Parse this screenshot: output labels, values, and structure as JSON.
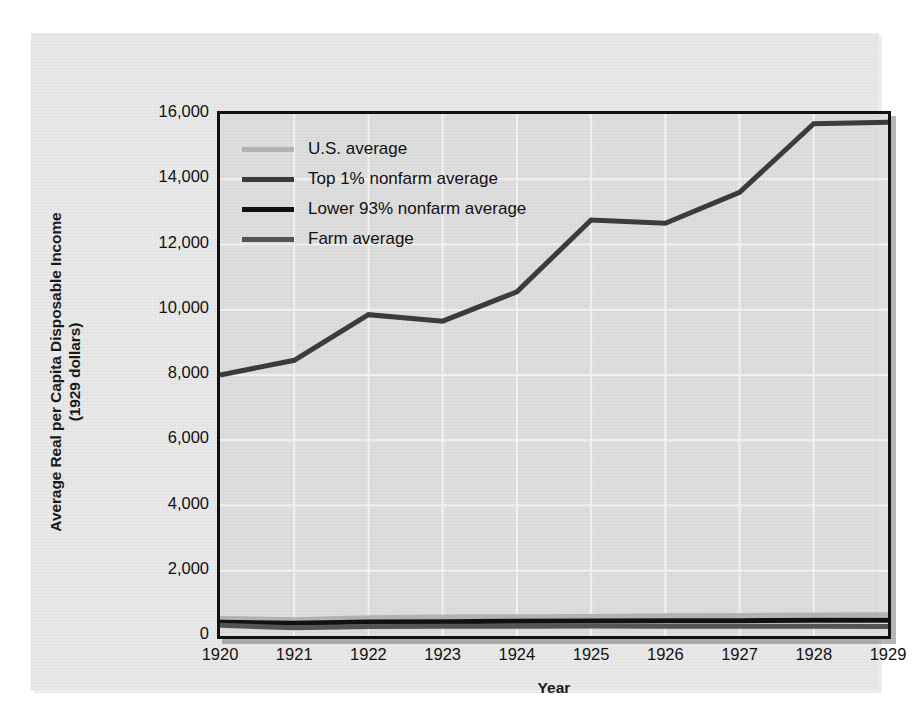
{
  "chart_data": {
    "type": "line",
    "title": "",
    "xlabel": "Year",
    "ylabel": "Average Real per Capita Disposable Income (1929 dollars)",
    "ylabel_line1": "Average Real per Capita Disposable Income",
    "ylabel_line2": "(1929 dollars)",
    "x": [
      1920,
      1921,
      1922,
      1923,
      1924,
      1925,
      1926,
      1927,
      1928,
      1929
    ],
    "categories": [
      "1920",
      "1921",
      "1922",
      "1923",
      "1924",
      "1925",
      "1926",
      "1927",
      "1928",
      "1929"
    ],
    "xlim": [
      1920,
      1929
    ],
    "ylim": [
      0,
      16000
    ],
    "yticks": [
      0,
      2000,
      4000,
      6000,
      8000,
      10000,
      12000,
      14000,
      16000
    ],
    "ytick_labels": [
      "0",
      "2,000",
      "4,000",
      "6,000",
      "8,000",
      "10,000",
      "12,000",
      "14,000",
      "16,000"
    ],
    "grid": true,
    "legend_position": "top-left inside plot",
    "plot_bg_color": "#dedede",
    "series": [
      {
        "name": "U.S. average",
        "color": "#b4b4b4",
        "width": 5,
        "values": [
          540,
          500,
          560,
          580,
          590,
          600,
          620,
          630,
          640,
          650
        ]
      },
      {
        "name": "Top 1% nonfarm average",
        "color": "#3c3c3c",
        "width": 5,
        "values": [
          8000,
          8450,
          9850,
          9650,
          10550,
          12750,
          12650,
          13600,
          15700,
          15750
        ]
      },
      {
        "name": "Lower 93% nonfarm average",
        "color": "#111111",
        "width": 5,
        "values": [
          420,
          390,
          430,
          440,
          450,
          460,
          470,
          470,
          480,
          480
        ]
      },
      {
        "name": "Farm average",
        "color": "#555555",
        "width": 5,
        "values": [
          330,
          250,
          290,
          300,
          300,
          305,
          300,
          300,
          300,
          295
        ]
      }
    ]
  }
}
